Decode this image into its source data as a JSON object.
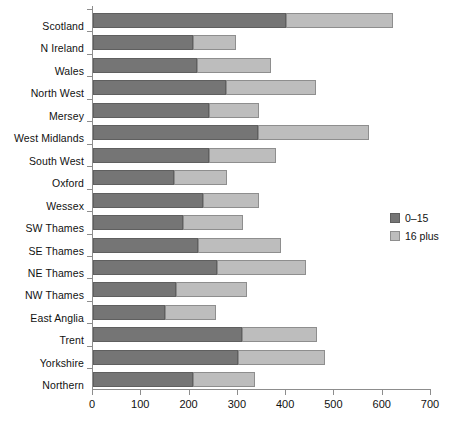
{
  "chart_data": {
    "type": "bar",
    "orientation": "horizontal",
    "stacked": true,
    "title": "",
    "xlabel": "",
    "ylabel": "",
    "xlim": [
      0,
      700
    ],
    "xticks": [
      0,
      100,
      200,
      300,
      400,
      500,
      600,
      700
    ],
    "grid": false,
    "legend_position": "right",
    "categories": [
      "Scotland",
      "N Ireland",
      "Wales",
      "North West",
      "Mersey",
      "West Midlands",
      "South West",
      "Oxford",
      "Wessex",
      "SW Thames",
      "SE Thames",
      "NE Thames",
      "NW Thames",
      "East Anglia",
      "Trent",
      "Yorkshire",
      "Northern"
    ],
    "series": [
      {
        "name": "0–15",
        "color": "#757575",
        "values": [
          400,
          207,
          215,
          275,
          241,
          342,
          240,
          168,
          228,
          187,
          217,
          257,
          172,
          149,
          308,
          300,
          207
        ]
      },
      {
        "name": "16 plus",
        "color": "#bdbdbd",
        "values": [
          221,
          89,
          153,
          187,
          102,
          230,
          139,
          109,
          115,
          123,
          172,
          184,
          147,
          106,
          155,
          180,
          129
        ]
      }
    ],
    "totals": [
      621,
      296,
      368,
      462,
      343,
      572,
      379,
      277,
      343,
      310,
      389,
      441,
      319,
      255,
      463,
      480,
      336
    ]
  },
  "legend": {
    "items": [
      {
        "label": "0–15"
      },
      {
        "label": "16 plus"
      }
    ]
  }
}
